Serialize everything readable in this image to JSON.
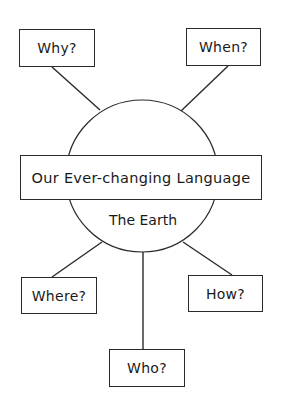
{
  "diagram": {
    "type": "spider-diagram",
    "center": {
      "title": "Our Ever-changing Language",
      "subtitle": "The Earth"
    },
    "nodes": [
      {
        "id": "why",
        "label": "Why?"
      },
      {
        "id": "when",
        "label": "When?"
      },
      {
        "id": "where",
        "label": "Where?"
      },
      {
        "id": "how",
        "label": "How?"
      },
      {
        "id": "who",
        "label": "Who?"
      }
    ],
    "colors": {
      "stroke": "#2a2a2a",
      "background": "#ffffff",
      "text": "#1a1a1a"
    }
  }
}
